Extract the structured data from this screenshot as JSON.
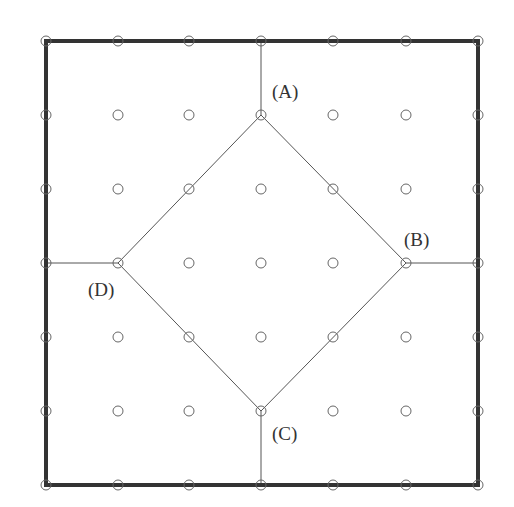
{
  "diagram": {
    "grid": {
      "xs": [
        46,
        118,
        189,
        261,
        333,
        406,
        478
      ],
      "ys": [
        41,
        115,
        189,
        263,
        337,
        411,
        485
      ],
      "point_radius": 5,
      "point_color": "#666666"
    },
    "border": {
      "x1": 46,
      "y1": 41,
      "x2": 478,
      "y2": 485,
      "stroke": "#333333",
      "width": 4
    },
    "diamond": {
      "stroke": "#555555",
      "vertices": {
        "A": [
          261,
          115
        ],
        "B": [
          406,
          263
        ],
        "C": [
          261,
          411
        ],
        "D": [
          118,
          263
        ]
      }
    },
    "connectors": [
      {
        "from": [
          261,
          41
        ],
        "to": [
          261,
          115
        ]
      },
      {
        "from": [
          406,
          263
        ],
        "to": [
          478,
          263
        ]
      },
      {
        "from": [
          261,
          411
        ],
        "to": [
          261,
          485
        ]
      },
      {
        "from": [
          46,
          263
        ],
        "to": [
          118,
          263
        ]
      }
    ],
    "labels": [
      {
        "text": "(A)",
        "x": 272,
        "y": 82
      },
      {
        "text": "(B)",
        "x": 404,
        "y": 230
      },
      {
        "text": "(C)",
        "x": 272,
        "y": 424
      },
      {
        "text": "(D)",
        "x": 88,
        "y": 280
      }
    ]
  }
}
